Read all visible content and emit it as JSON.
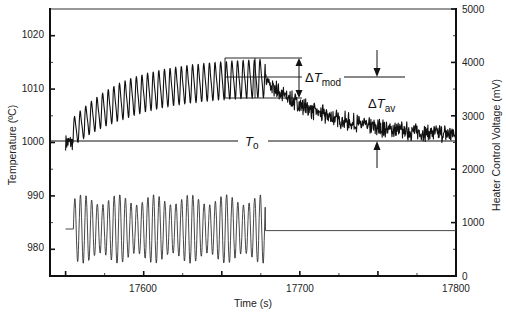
{
  "chart_data": {
    "type": "line",
    "title": "",
    "xlabel": "Time (s)",
    "ylabel": "Temperature (ºC)",
    "y2label": "Heater Control Voltage (mV)",
    "xlim": [
      17540,
      17800
    ],
    "ylim": [
      975,
      1025
    ],
    "y2lim": [
      0,
      5000
    ],
    "x_ticks": [
      17600,
      17700,
      17800
    ],
    "x_minor_ticks": [
      17550,
      17575,
      17600,
      17625,
      17650,
      17675,
      17700,
      17725,
      17750,
      17775
    ],
    "y_ticks": [
      980,
      990,
      1000,
      1010,
      1020
    ],
    "y2_ticks": [
      0,
      1000,
      2000,
      3000,
      4000,
      5000
    ],
    "grid": false,
    "legend": null,
    "series": [
      {
        "name": "Temperature",
        "axis": "left",
        "description": "Noisy baseline near 1000 ºC, then rise with sinusoidal modulation (~3.6 s period, ~±3 ºC) to mean ~1012 ºC while heater is modulated, then noisy exponential decay back toward ~1001 ºC after modulation stops.",
        "segments": [
          {
            "x_start": 17550,
            "x_end": 17555,
            "mean": 1000,
            "amp": 1.5,
            "kind": "noise"
          },
          {
            "x_start": 17555,
            "x_end": 17678,
            "mean_start": 1002,
            "mean_end": 1012,
            "amp": 3.6,
            "period_s": 3.6,
            "kind": "modulated_rise"
          },
          {
            "x_start": 17678,
            "x_end": 17800,
            "mean_start": 1011.5,
            "mean_end": 1001,
            "noise": 1.0,
            "kind": "decay"
          }
        ]
      },
      {
        "name": "Heater Control Voltage",
        "axis": "right",
        "description": "Flat ~900 mV, then sinusoidal modulation (~3.6 s period, ~400–1500 mV) until ~17678 s, then flat ~880 mV.",
        "segments": [
          {
            "x_start": 17550,
            "x_end": 17555,
            "value": 880,
            "kind": "flat"
          },
          {
            "x_start": 17555,
            "x_end": 17678,
            "mean": 880,
            "amp": 650,
            "period_s": 3.6,
            "kind": "sine"
          },
          {
            "x_start": 17678,
            "x_end": 17800,
            "value": 850,
            "kind": "flat"
          }
        ]
      }
    ],
    "annotations": [
      {
        "text": "ΔT",
        "sub": "mod",
        "meaning": "modulation amplitude between dashed box lines ~1008–1015.5 ºC"
      },
      {
        "text": "ΔT",
        "sub": "av",
        "meaning": "difference between mean modulated temperature (~1012 ºC) and T_o"
      },
      {
        "text": "T",
        "sub": "o",
        "meaning": "baseline temperature 1000 ºC"
      }
    ],
    "reference_lines": {
      "T_o": 1000,
      "mod_top": 1015.5,
      "mod_mid": 1012,
      "mod_bottom": 1008
    }
  },
  "labels": {
    "xlabel": "Time (s)",
    "ylabel": "Temperature (ºC)",
    "y2label": "Heater Control Voltage (mV)",
    "x_ticks": [
      "17600",
      "17700",
      "17800"
    ],
    "y_ticks": [
      "1020",
      "1010",
      "1000",
      "990",
      "980"
    ],
    "y2_ticks": [
      "5000",
      "4000",
      "3000",
      "2000",
      "1000",
      "0"
    ],
    "delta": "Δ",
    "T": "T",
    "mod_sub": "mod",
    "av_sub": "av",
    "o_sub": "o"
  },
  "colors": {
    "trace": "#111111",
    "axis": "#111111",
    "background": "#ffffff"
  }
}
